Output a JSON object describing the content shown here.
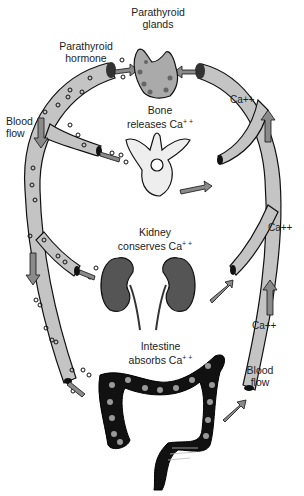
{
  "diagram": {
    "labels": {
      "parathyroid_glands": [
        "Parathyroid",
        "glands"
      ],
      "parathyroid_hormone": [
        "Parathyroid",
        "hormone"
      ],
      "blood_flow_left": [
        "Blood",
        "flow"
      ],
      "blood_flow_right": [
        "Blood",
        "flow"
      ],
      "bone": [
        "Bone",
        "releases Ca"
      ],
      "kidney": [
        "Kidney",
        "conserves Ca"
      ],
      "intestine": [
        "Intestine",
        "absorbs Ca"
      ],
      "superscript": "+ +"
    },
    "calcium_markers": [
      "Ca++",
      "Ca++",
      "Ca++"
    ],
    "colors": {
      "vessel_fill": "#c4c4c4",
      "outline": "#111111",
      "arrow_fill": "#8a8a8a",
      "organ_dark": "#555555",
      "intestine": "#111111",
      "bone_fill": "#eeeeee"
    }
  }
}
